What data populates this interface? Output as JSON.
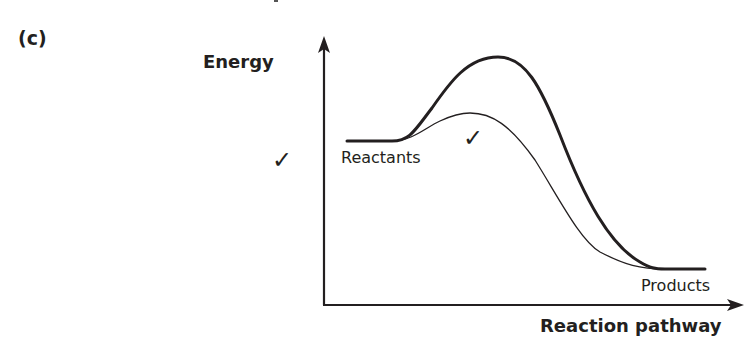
{
  "question": {
    "part_label": "(c)",
    "marks": [
      "✓",
      "✓"
    ]
  },
  "diagram": {
    "type": "energy-profile",
    "y_axis_label": "Energy",
    "x_axis_label": "Reaction pathway",
    "labels": {
      "reactants": "Reactants",
      "products": "Products"
    },
    "curves": [
      {
        "name": "uncatalysed",
        "stroke_width": 3,
        "peak_height": "high"
      },
      {
        "name": "catalysed",
        "stroke_width": 1.3,
        "peak_height": "low"
      }
    ],
    "colors": {
      "ink": "#231f20",
      "background": "#ffffff"
    }
  }
}
